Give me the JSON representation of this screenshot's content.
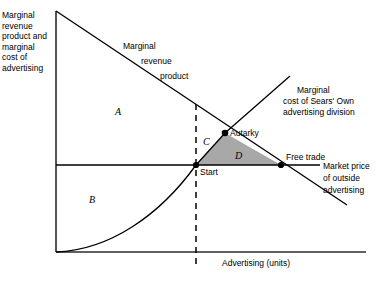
{
  "figure": {
    "type": "economics-diagram",
    "axes": {
      "y_axis_label": "Marginal\nrevenue\nproduct and\nmarginal\ncost of\nadvertising",
      "x_axis_label": "Advertising (units)"
    },
    "curves": [
      {
        "name": "marginal-revenue-product",
        "label": "Marginal\n   revenue\n      product",
        "label_lines": [
          "Marginal",
          "revenue",
          "product"
        ],
        "style": "downward-sloping-straight"
      },
      {
        "name": "marginal-cost-of-sears-own-advertising-division",
        "label": "Marginal\ncost of Sears' Own\nadvertising division",
        "label_lines": [
          "Marginal",
          "cost of Sears' Own",
          "advertising division"
        ],
        "style": "upward-sloping-convex"
      },
      {
        "name": "market-price-of-outside-advertising",
        "label": "Market price\nof outside\nadvertising",
        "label_lines": [
          "Market price",
          "of outside",
          "advertising"
        ],
        "style": "horizontal"
      }
    ],
    "points": [
      {
        "name": "start",
        "label": "Start"
      },
      {
        "name": "autarky",
        "label": "Autarky"
      },
      {
        "name": "free-trade",
        "label": "Free trade"
      }
    ],
    "regions": [
      {
        "name": "region-a",
        "label": "A"
      },
      {
        "name": "region-b",
        "label": "B"
      },
      {
        "name": "region-c",
        "label": "C"
      },
      {
        "name": "region-d",
        "label": "D",
        "shaded": true
      }
    ],
    "colors": {
      "line": "#000000",
      "shaded_region_fill": "#a8a8a8",
      "background": "#ffffff"
    }
  }
}
